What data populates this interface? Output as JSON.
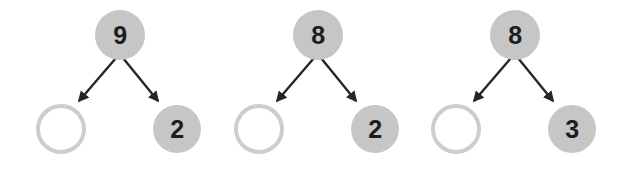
{
  "worksheet": {
    "title": "Number bond fill-in exercise",
    "background_color": "#ffffff",
    "node_fill_color": "#c6c6c6",
    "node_empty_stroke_color": "#cdcdcd",
    "arrow_color": "#262626",
    "digit_color": "#1d1d1d"
  },
  "groups": [
    {
      "id": "number-bond-1",
      "whole": "9",
      "left_part": "",
      "left_part_state": "empty",
      "right_part": "2",
      "right_part_state": "filled",
      "arrows": [
        {
          "name": "arrow-to-left-part",
          "direction": "down-left"
        },
        {
          "name": "arrow-to-right-part",
          "direction": "down-right"
        }
      ]
    },
    {
      "id": "number-bond-2",
      "whole": "8",
      "left_part": "",
      "left_part_state": "empty",
      "right_part": "2",
      "right_part_state": "filled",
      "arrows": [
        {
          "name": "arrow-to-left-part",
          "direction": "down-left"
        },
        {
          "name": "arrow-to-right-part",
          "direction": "down-right"
        }
      ]
    },
    {
      "id": "number-bond-3",
      "whole": "8",
      "left_part": "",
      "left_part_state": "empty",
      "right_part": "3",
      "right_part_state": "filled",
      "arrows": [
        {
          "name": "arrow-to-left-part",
          "direction": "down-left"
        },
        {
          "name": "arrow-to-right-part",
          "direction": "down-right"
        }
      ]
    }
  ]
}
